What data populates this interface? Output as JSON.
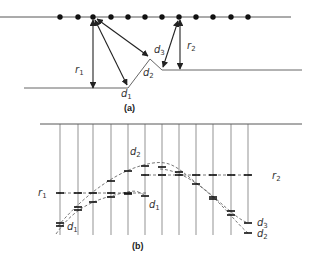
{
  "figure_a": {
    "caption": "(a)",
    "labels": {
      "r1": {
        "main": "r",
        "sub": "1"
      },
      "r2": {
        "main": "r",
        "sub": "2"
      },
      "d1": {
        "main": "d",
        "sub": "1"
      },
      "d2": {
        "main": "d",
        "sub": "2"
      },
      "d3": {
        "main": "d",
        "sub": "3"
      }
    },
    "receiver_count": 12
  },
  "figure_b": {
    "caption": "(b)",
    "labels": {
      "r1": {
        "main": "r",
        "sub": "1"
      },
      "r2": {
        "main": "r",
        "sub": "2"
      },
      "d1_left": {
        "main": "d",
        "sub": "1"
      },
      "d1_mid": {
        "main": "d",
        "sub": "1"
      },
      "d2_top": {
        "main": "d",
        "sub": "2"
      },
      "d3_right": {
        "main": "d",
        "sub": "3"
      },
      "d2_right": {
        "main": "d",
        "sub": "2"
      }
    },
    "trace_count": 12
  },
  "colors": {
    "line": "#333333",
    "dash": "#555555",
    "tick": "#222222"
  }
}
